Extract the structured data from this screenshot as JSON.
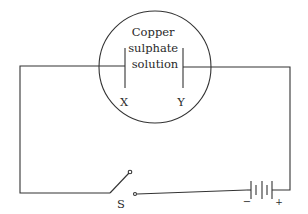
{
  "diagram": {
    "type": "electrolysis-circuit",
    "vessel": {
      "label_lines": [
        "Copper",
        "sulphate",
        "solution"
      ]
    },
    "electrodes": {
      "left": "X",
      "right": "Y"
    },
    "switch": {
      "label": "S"
    },
    "battery": {
      "negative": "−",
      "positive": "+"
    },
    "colors": {
      "line": "#333333",
      "text": "#2a2a2a"
    }
  }
}
